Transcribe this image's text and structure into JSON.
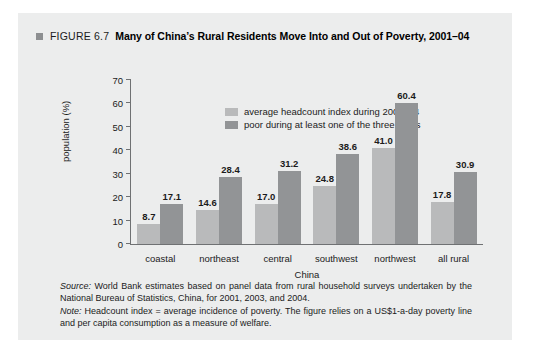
{
  "figure": {
    "marker": "square-bullet",
    "number_label": "FIGURE 6.7",
    "title": "Many of China’s Rural Residents Move Into and Out of Poverty, 2001–04"
  },
  "chart_data": {
    "type": "bar",
    "title": "Many of China’s Rural Residents Move Into and Out of Poverty, 2001–04",
    "categories": [
      "coastal",
      "northeast",
      "central",
      "southwest",
      "northwest",
      "all rural"
    ],
    "series": [
      {
        "name": "average headcount index during 2001–04",
        "color": "#b9babb",
        "values": [
          8.7,
          14.6,
          17.0,
          24.8,
          41.0,
          17.8
        ]
      },
      {
        "name": "poor during at least one of the three years",
        "color": "#929496",
        "values": [
          17.1,
          28.4,
          31.2,
          38.6,
          60.4,
          30.9
        ]
      }
    ],
    "xlabel": "China",
    "ylabel": "population (%)",
    "ylim": [
      0,
      70
    ],
    "yticks": [
      0,
      10,
      20,
      30,
      40,
      50,
      60,
      70
    ],
    "grid": false,
    "legend_position": "top-left-inside"
  },
  "footnotes": {
    "source_lead": "Source:",
    "source_text": " World Bank estimates based on panel data from rural household surveys undertaken by the National Bureau of Statistics, China, for 2001, 2003, and 2004.",
    "note_lead": "Note:",
    "note_text": " Headcount index = average incidence of poverty. The figure relies on a US$1-a-day poverty line and per capita consumption as a measure of welfare."
  }
}
